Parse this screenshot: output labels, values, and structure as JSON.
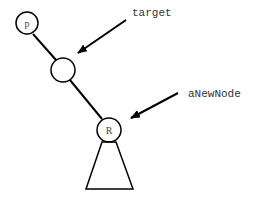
{
  "diagram": {
    "nodes": [
      {
        "id": "p",
        "label": "p"
      },
      {
        "id": "target-node",
        "label": ""
      },
      {
        "id": "R",
        "label": "R"
      }
    ],
    "annotations": {
      "target": "target",
      "new_node": "aNewNode"
    },
    "colors": {
      "stroke": "#000000",
      "text": "#333333",
      "background": "#ffffff"
    }
  }
}
